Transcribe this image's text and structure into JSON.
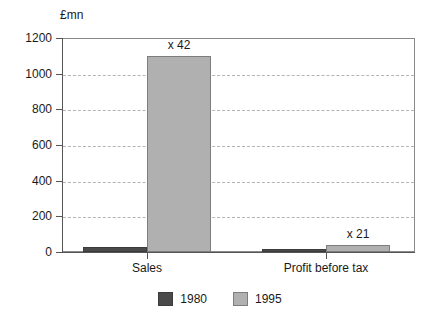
{
  "chart_data": {
    "type": "bar",
    "title": "",
    "subtitle": "",
    "xlabel": "",
    "ylabel": "£mn",
    "categories": [
      "Sales",
      "Profit before tax"
    ],
    "series": [
      {
        "name": "1980",
        "color": "#4a4a4a",
        "values": [
          26,
          10
        ]
      },
      {
        "name": "1995",
        "color": "#b0b0b0",
        "values": [
          1100,
          40
        ]
      }
    ],
    "annotations": [
      {
        "text": "x 42",
        "category": "Sales",
        "series": "1995"
      },
      {
        "text": "x 21",
        "category": "Profit before tax",
        "series": "1995"
      }
    ],
    "ylim": [
      0,
      1200
    ],
    "yticks": [
      0,
      200,
      400,
      600,
      800,
      1000,
      1200
    ],
    "ytick_labels": [
      "0",
      "200",
      "400",
      "600",
      "800",
      "1000",
      "1200"
    ],
    "grid": true,
    "grid_style": "dashed",
    "grid_axis": "y",
    "legend_position": "bottom-center",
    "legend_entries": [
      "1980",
      "1995"
    ]
  }
}
